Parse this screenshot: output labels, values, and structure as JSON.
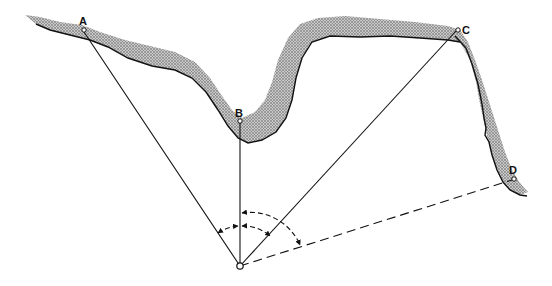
{
  "figure": {
    "points": [
      {
        "id": "A",
        "label": "A"
      },
      {
        "id": "B",
        "label": "B"
      },
      {
        "id": "C",
        "label": "C"
      },
      {
        "id": "D",
        "label": "D"
      }
    ],
    "origin": {
      "id": "O",
      "label": ""
    },
    "sight_lines": [
      {
        "from": "O",
        "to": "A",
        "style": "solid"
      },
      {
        "from": "O",
        "to": "B",
        "style": "solid"
      },
      {
        "from": "O",
        "to": "C",
        "style": "solid"
      },
      {
        "from": "O",
        "to": "D",
        "style": "dashed"
      }
    ],
    "angle_arcs": [
      {
        "between": [
          "A",
          "B"
        ],
        "style": "dashed",
        "arrowheads": "both"
      },
      {
        "between": [
          "B",
          "C"
        ],
        "style": "dashed",
        "arrowheads": "both"
      },
      {
        "between": [
          "B",
          "D"
        ],
        "style": "dashed",
        "arrowheads": "both"
      }
    ],
    "colors": {
      "line": "#111111",
      "band_fill": "#bdbdbd",
      "band_dot": "#555555",
      "background": "#ffffff"
    }
  }
}
